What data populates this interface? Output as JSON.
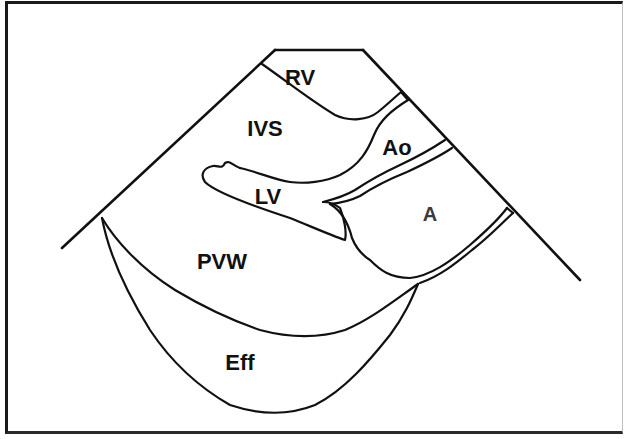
{
  "diagram": {
    "type": "echocardiogram-schematic",
    "colors": {
      "line": "#111111",
      "background": "#ffffff",
      "frame": "#1a1a1a"
    },
    "labels": {
      "rv": "RV",
      "ivs": "IVS",
      "ao": "Ao",
      "lv": "LV",
      "la": "A",
      "pvw": "PVW",
      "eff": "Eff"
    },
    "label_meanings": {
      "RV": "Right ventricle",
      "IVS": "Interventricular septum",
      "Ao": "Aorta",
      "LV": "Left ventricle",
      "A": "Left atrium",
      "PVW": "Posterior ventricular wall",
      "Eff": "Effusion"
    }
  }
}
